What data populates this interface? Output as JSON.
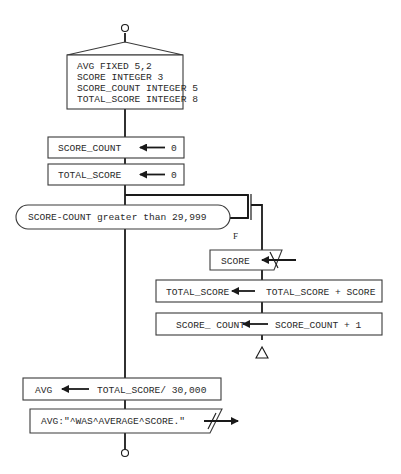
{
  "diagram": {
    "type": "structured-flowchart",
    "declarations": {
      "lines": [
        "AVG FIXED 5,2",
        "SCORE INTEGER 3",
        "SCORE_COUNT INTEGER 5",
        "TOTAL_SCORE INTEGER 8"
      ]
    },
    "init_score_count": {
      "target": "SCORE_COUNT",
      "value": "0"
    },
    "init_total_score": {
      "target": "TOTAL_SCORE",
      "value": "0"
    },
    "loop_condition": {
      "text": "SCORE-COUNT greater than 29,999",
      "false_label": "F"
    },
    "loop_body": {
      "input": {
        "text": "SCORE"
      },
      "accumulate": {
        "target": "TOTAL_SCORE",
        "expr": "TOTAL_SCORE + SCORE"
      },
      "increment": {
        "target": "SCORE_ COUNT",
        "expr": "SCORE_COUNT + 1"
      }
    },
    "compute_avg": {
      "target": "AVG",
      "expr": "TOTAL_SCORE/ 30,000"
    },
    "output": {
      "text": "AVG:\"^WAS^AVERAGE^SCORE.\""
    }
  }
}
